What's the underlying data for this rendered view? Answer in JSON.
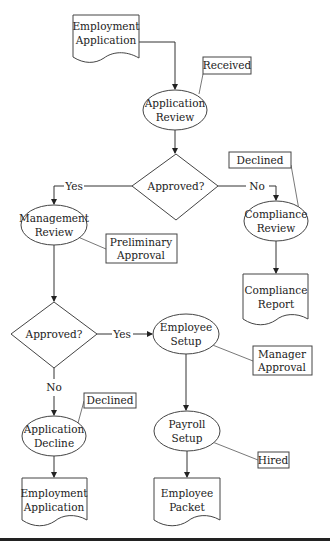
{
  "diagram": {
    "type": "flowchart",
    "nodes": {
      "doc_employment_application_top": {
        "lines": [
          "Employment",
          "Application"
        ],
        "shape": "document"
      },
      "application_review": {
        "lines": [
          "Application",
          "Review"
        ],
        "shape": "ellipse"
      },
      "note_received": {
        "label": "Received",
        "shape": "annotation"
      },
      "decision_1": {
        "label": "Approved?",
        "shape": "diamond"
      },
      "decision_1_yes": "Yes",
      "decision_1_no": "No",
      "management_review": {
        "lines": [
          "Management",
          "Review"
        ],
        "shape": "ellipse"
      },
      "note_preliminary_approval": {
        "lines": [
          "Preliminary",
          "Approval"
        ],
        "shape": "annotation"
      },
      "compliance_review": {
        "lines": [
          "Compliance",
          "Review"
        ],
        "shape": "ellipse"
      },
      "note_declined_1": {
        "label": "Declined",
        "shape": "annotation"
      },
      "doc_compliance_report": {
        "lines": [
          "Compliance",
          "Report"
        ],
        "shape": "document"
      },
      "decision_2": {
        "label": "Approved?",
        "shape": "diamond"
      },
      "decision_2_yes": "Yes",
      "decision_2_no": "No",
      "employee_setup": {
        "lines": [
          "Employee",
          "Setup"
        ],
        "shape": "ellipse"
      },
      "note_manager_approval": {
        "lines": [
          "Manager",
          "Approval"
        ],
        "shape": "annotation"
      },
      "application_decline": {
        "lines": [
          "Application",
          "Decline"
        ],
        "shape": "ellipse"
      },
      "note_declined_2": {
        "label": "Declined",
        "shape": "annotation"
      },
      "payroll_setup": {
        "lines": [
          "Payroll",
          "Setup"
        ],
        "shape": "ellipse"
      },
      "note_hired": {
        "label": "Hired",
        "shape": "annotation"
      },
      "doc_employment_application_bottom": {
        "lines": [
          "Employment",
          "Application"
        ],
        "shape": "document"
      },
      "doc_employee_packet": {
        "lines": [
          "Employee",
          "Packet"
        ],
        "shape": "document"
      }
    },
    "edges": [
      {
        "from": "doc_employment_application_top",
        "to": "application_review"
      },
      {
        "from": "application_review",
        "to": "decision_1"
      },
      {
        "from": "decision_1",
        "to": "management_review",
        "label": "Yes"
      },
      {
        "from": "decision_1",
        "to": "compliance_review",
        "label": "No"
      },
      {
        "from": "compliance_review",
        "to": "doc_compliance_report"
      },
      {
        "from": "management_review",
        "to": "decision_2"
      },
      {
        "from": "decision_2",
        "to": "employee_setup",
        "label": "Yes"
      },
      {
        "from": "decision_2",
        "to": "application_decline",
        "label": "No"
      },
      {
        "from": "employee_setup",
        "to": "payroll_setup"
      },
      {
        "from": "application_decline",
        "to": "doc_employment_application_bottom"
      },
      {
        "from": "payroll_setup",
        "to": "doc_employee_packet"
      }
    ]
  }
}
